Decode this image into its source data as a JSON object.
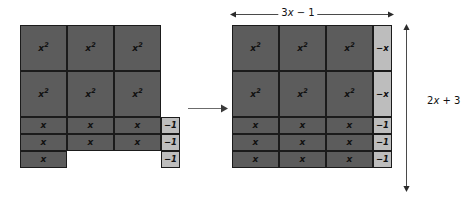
{
  "figure": {
    "type": "algebra-tiles-area-model",
    "tile_labels": {
      "x_squared": "x²",
      "x": "x",
      "neg_x": "−x",
      "neg_one": "−1"
    },
    "colors": {
      "positive_tile": "#5c5c5c",
      "negative_tile": "#bdbdbd",
      "tile_border": "#1b1b1b",
      "arrow": "#6b6b6b",
      "text": "#111111",
      "background": "#ffffff"
    }
  },
  "left_panel": {
    "name": "unarranged-tiles",
    "rows": [
      {
        "kind": "x-squared-row",
        "count": 3,
        "label": "x²",
        "shade": "dark"
      },
      {
        "kind": "x-squared-row",
        "count": 3,
        "label": "x²",
        "shade": "dark"
      },
      {
        "kind": "x-row",
        "count": 3,
        "label": "x",
        "shade": "dark"
      },
      {
        "kind": "x-row",
        "count": 3,
        "label": "x",
        "shade": "dark"
      },
      {
        "kind": "x-row",
        "count": 1,
        "label": "x",
        "shade": "dark"
      }
    ],
    "loose_unit_tiles": {
      "count": 3,
      "label": "−1",
      "shade": "light"
    },
    "totals": {
      "x_squared_tiles": 6,
      "x_tiles": 7,
      "negative_unit_tiles": 3
    }
  },
  "transform": {
    "name": "rearrange-arrow",
    "direction": "right"
  },
  "right_panel": {
    "name": "arranged-rectangle",
    "grid_rows": [
      {
        "kind": "x-squared-row",
        "cells": [
          {
            "label": "x²",
            "shade": "dark"
          },
          {
            "label": "x²",
            "shade": "dark"
          },
          {
            "label": "x²",
            "shade": "dark"
          },
          {
            "label": "−x",
            "shade": "light"
          }
        ]
      },
      {
        "kind": "x-squared-row",
        "cells": [
          {
            "label": "x²",
            "shade": "dark"
          },
          {
            "label": "x²",
            "shade": "dark"
          },
          {
            "label": "x²",
            "shade": "dark"
          },
          {
            "label": "−x",
            "shade": "light"
          }
        ]
      },
      {
        "kind": "x-row",
        "cells": [
          {
            "label": "x",
            "shade": "dark"
          },
          {
            "label": "x",
            "shade": "dark"
          },
          {
            "label": "x",
            "shade": "dark"
          },
          {
            "label": "−1",
            "shade": "light"
          }
        ]
      },
      {
        "kind": "x-row",
        "cells": [
          {
            "label": "x",
            "shade": "dark"
          },
          {
            "label": "x",
            "shade": "dark"
          },
          {
            "label": "x",
            "shade": "dark"
          },
          {
            "label": "−1",
            "shade": "light"
          }
        ]
      },
      {
        "kind": "x-row",
        "cells": [
          {
            "label": "x",
            "shade": "dark"
          },
          {
            "label": "x",
            "shade": "dark"
          },
          {
            "label": "x",
            "shade": "dark"
          },
          {
            "label": "−1",
            "shade": "light"
          }
        ]
      }
    ],
    "dimensions": {
      "width_label": "3x − 1",
      "height_label": "2x + 3"
    }
  }
}
